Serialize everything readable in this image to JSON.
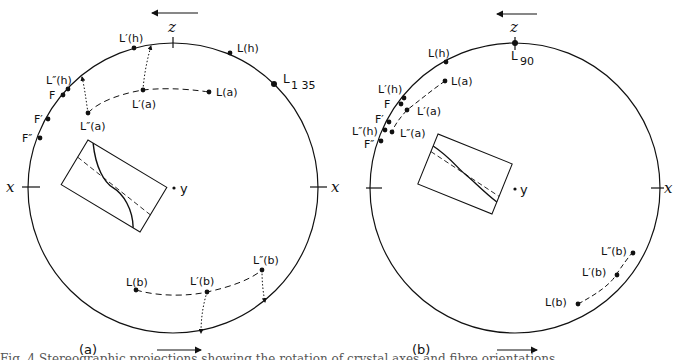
{
  "figure": {
    "panels": [
      {
        "id": "a",
        "label": "(a)",
        "top_axis_label": "z",
        "left_axis_label": "x",
        "right_axis_label": "x",
        "center_label": "y",
        "top_arrow_direction": "left",
        "bottom_arrow_direction": "right",
        "points": {
          "L_h": "L(h)",
          "L1_35": "L",
          "L1_35_sub": "1 35",
          "L1_h": "L′(h)",
          "L2_h": "L″(h)",
          "F": "F",
          "F1": "F′",
          "F2": "F″",
          "L_a": "L(a)",
          "L1_a": "L′(a)",
          "L2_a": "L″(a)",
          "L_b": "L(b)",
          "L1_b": "L′(b)",
          "L2_b": "L″(b)"
        }
      },
      {
        "id": "b",
        "label": "(b)",
        "top_axis_label": "z",
        "left_axis_label": "x",
        "right_axis_label": "x",
        "center_label": "y",
        "top_arrow_direction": "left",
        "bottom_arrow_direction": "right",
        "points": {
          "L90": "L",
          "L90_sub": "90",
          "L_h": "L(h)",
          "L1_h": "L′(h)",
          "L2_h": "L″(h)",
          "F": "F",
          "F1": "F′",
          "F2": "F″",
          "L_a": "L(a)",
          "L1_a": "L′(a)",
          "L2_a": "L″(a)",
          "L_b": "L(b)",
          "L1_b": "L′(b)",
          "L2_b": "L″(b)"
        }
      }
    ],
    "caption_fragment": "Fig. 4 Stereographic projections showing the rotation of crystal axes and fibre orientations"
  }
}
